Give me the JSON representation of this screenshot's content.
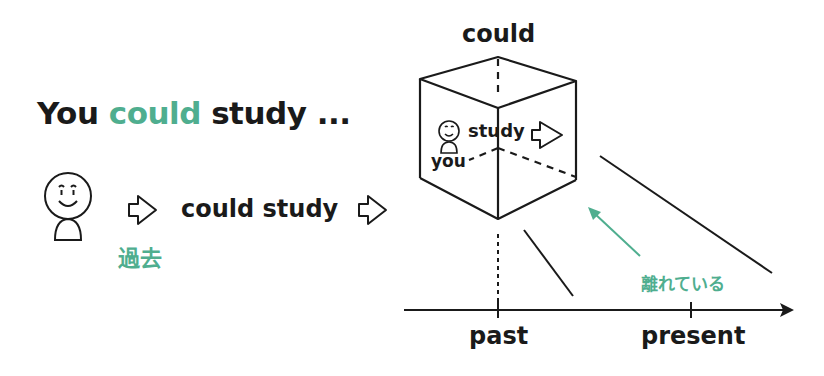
{
  "headline": {
    "prefix": "You",
    "highlight": "could",
    "suffix": "study ..."
  },
  "left_flow": {
    "person_icon": "smiley-person-icon",
    "arrow_icon": "outline-right-arrow-icon",
    "verb_phrase": "could study",
    "tense_label": "過去"
  },
  "cube": {
    "top_label": "could",
    "inner_subject": "you",
    "inner_verb": "study"
  },
  "timeline": {
    "tick_labels": [
      "past",
      "present"
    ],
    "distance_label": "離れている"
  },
  "colors": {
    "accent": "#4fae8f",
    "ink": "#1a1a1a"
  }
}
